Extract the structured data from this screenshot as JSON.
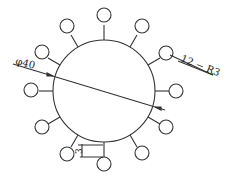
{
  "drawing": {
    "main_diameter_label": "φ40",
    "holes_label": "12 − R3",
    "offset_label": "3",
    "hole_count": 12,
    "stroke_color": "#333333",
    "background": "#ffffff"
  }
}
